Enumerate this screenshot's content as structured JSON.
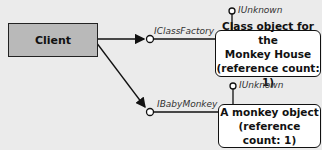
{
  "client": {
    "label": "Client"
  },
  "class_object": {
    "interface_label": "IClassFactory",
    "unknown_label": "IUnknown",
    "lines": [
      "Class object for the",
      "Monkey House",
      "(reference count: 1)"
    ]
  },
  "monkey_object": {
    "interface_label": "IBabyMonkey",
    "unknown_label": "IUnknown",
    "lines": [
      "A monkey object",
      "(reference count: 1)"
    ]
  },
  "colors": {
    "background": "#ebebeb",
    "client_fill": "#b9b9b9",
    "object_fill": "#ffffff",
    "stroke": "#111111"
  }
}
